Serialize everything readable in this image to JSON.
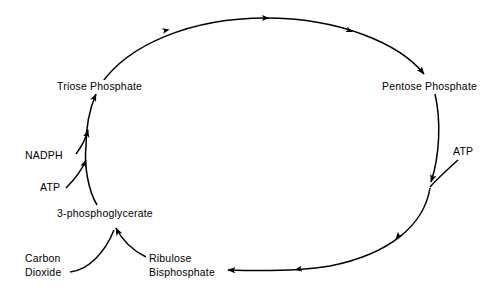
{
  "diagram": {
    "type": "cycle-diagram",
    "stroke_color": "#000000",
    "background_color": "#ffffff",
    "nodes": [
      {
        "id": "triose-phosphate",
        "label": "Triose Phosphate"
      },
      {
        "id": "pentose-phosphate",
        "label": "Pentose Phosphate"
      },
      {
        "id": "ribulose-bisphosphate",
        "label": "Ribulose\nBisphosphate"
      },
      {
        "id": "3-phosphoglycerate",
        "label": "3-phosphoglycerate"
      }
    ],
    "inputs": [
      {
        "id": "nadph",
        "label": "NADPH",
        "target": "triose-phosphate"
      },
      {
        "id": "atp-left",
        "label": "ATP",
        "target": "triose-phosphate"
      },
      {
        "id": "atp-right",
        "label": "ATP",
        "target": "ribulose-bisphosphate"
      },
      {
        "id": "carbon-dioxide",
        "label": "Carbon\nDioxide",
        "target": "3-phosphoglycerate"
      }
    ],
    "flow": [
      {
        "from": "triose-phosphate",
        "to": "pentose-phosphate",
        "direction": "clockwise-top"
      },
      {
        "from": "pentose-phosphate",
        "to": "ribulose-bisphosphate",
        "direction": "clockwise-right"
      },
      {
        "from": "ribulose-bisphosphate",
        "to": "3-phosphoglycerate",
        "direction": "upward-left"
      },
      {
        "from": "3-phosphoglycerate",
        "to": "triose-phosphate",
        "direction": "upward-left"
      }
    ]
  }
}
